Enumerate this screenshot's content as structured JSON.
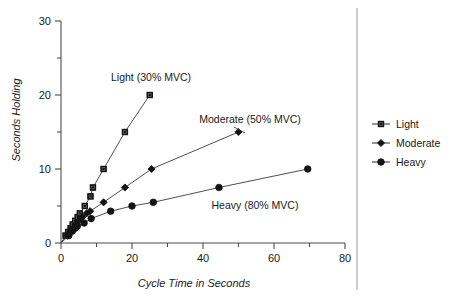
{
  "chart_data": {
    "type": "line",
    "title": "",
    "subtitle": "",
    "xlabel": "Cycle Time in Seconds",
    "ylabel": "Seconds Holding",
    "xlim": [
      0,
      80
    ],
    "ylim": [
      0,
      30
    ],
    "x_major_ticks": [
      0,
      20,
      40,
      60,
      80
    ],
    "x_minor_ticks": [
      10,
      30,
      50,
      70
    ],
    "y_major_ticks": [
      0,
      10,
      20,
      30
    ],
    "y_minor_ticks": [
      5,
      15,
      25
    ],
    "x_tick_labels": [
      "0",
      "20",
      "40",
      "60",
      "80"
    ],
    "y_tick_labels": [
      "0",
      "10",
      "20",
      "30"
    ],
    "grid": false,
    "legend_position": "right",
    "series": [
      {
        "name": "Light",
        "marker": "square",
        "points": [
          {
            "x": 0.0,
            "y": 0.0
          },
          {
            "x": 1.3,
            "y": 1.0
          },
          {
            "x": 2.0,
            "y": 1.5
          },
          {
            "x": 2.7,
            "y": 2.0
          },
          {
            "x": 3.3,
            "y": 2.5
          },
          {
            "x": 4.0,
            "y": 3.0
          },
          {
            "x": 4.7,
            "y": 3.5
          },
          {
            "x": 5.3,
            "y": 4.0
          },
          {
            "x": 6.7,
            "y": 5.0
          },
          {
            "x": 8.3,
            "y": 6.3
          },
          {
            "x": 9.0,
            "y": 7.5
          },
          {
            "x": 12.0,
            "y": 10.0
          },
          {
            "x": 18.0,
            "y": 15.0
          },
          {
            "x": 25.0,
            "y": 20.0
          }
        ]
      },
      {
        "name": "Moderate",
        "marker": "diamond",
        "points": [
          {
            "x": 0.0,
            "y": 0.0
          },
          {
            "x": 1.8,
            "y": 1.0
          },
          {
            "x": 2.6,
            "y": 1.5
          },
          {
            "x": 3.4,
            "y": 2.0
          },
          {
            "x": 4.2,
            "y": 2.5
          },
          {
            "x": 5.0,
            "y": 3.0
          },
          {
            "x": 6.0,
            "y": 3.5
          },
          {
            "x": 7.2,
            "y": 4.0
          },
          {
            "x": 8.2,
            "y": 4.3
          },
          {
            "x": 12.0,
            "y": 5.5
          },
          {
            "x": 18.0,
            "y": 7.5
          },
          {
            "x": 25.5,
            "y": 10.0
          },
          {
            "x": 50.0,
            "y": 15.0
          }
        ]
      },
      {
        "name": "Heavy",
        "marker": "circle",
        "points": [
          {
            "x": 0.0,
            "y": 0.0
          },
          {
            "x": 2.2,
            "y": 1.0
          },
          {
            "x": 3.2,
            "y": 1.6
          },
          {
            "x": 4.0,
            "y": 2.0
          },
          {
            "x": 4.6,
            "y": 2.3
          },
          {
            "x": 6.5,
            "y": 2.7
          },
          {
            "x": 8.5,
            "y": 3.3
          },
          {
            "x": 14.0,
            "y": 4.3
          },
          {
            "x": 20.0,
            "y": 5.0
          },
          {
            "x": 26.0,
            "y": 5.5
          },
          {
            "x": 44.5,
            "y": 7.5
          },
          {
            "x": 69.5,
            "y": 10.0
          }
        ]
      }
    ],
    "annotations": [
      {
        "text": "Light (30% MVC)",
        "x_px": 151,
        "y_px": 81,
        "anchor": "middle"
      },
      {
        "text": "Moderate (50% MVC)",
        "x_px": 250,
        "y_px": 123,
        "anchor": "middle"
      },
      {
        "text": "Heavy (80% MVC)",
        "x_px": 255,
        "y_px": 209,
        "anchor": "middle"
      }
    ],
    "legend_entries": [
      {
        "label": "Light",
        "marker": "square"
      },
      {
        "label": "Moderate",
        "marker": "diamond"
      },
      {
        "label": "Heavy",
        "marker": "circle"
      }
    ],
    "colors": {
      "axis": "#4d4d4d",
      "line": "#3c3c3c",
      "marker_fill": "#141414",
      "marker_light_fill": "#5a5a5a",
      "text": "#1a1a1a",
      "background": "#ffffff",
      "legend_divider": "#9a9a9a"
    }
  }
}
